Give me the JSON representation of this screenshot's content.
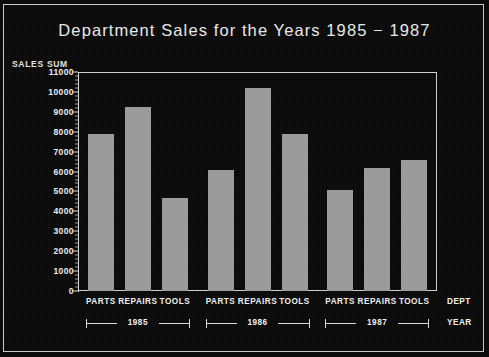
{
  "chart_data": {
    "type": "bar",
    "title": "Department Sales for the Years 1985 − 1987",
    "xlabel": "DEPT",
    "ylabel": "SALES SUM",
    "grid": false,
    "legend": "none",
    "ylim": [
      0,
      11000
    ],
    "ytick_step": 1000,
    "ytick_labels": [
      "11000",
      "10000",
      "9000",
      "8000",
      "7000",
      "6000",
      "5000",
      "4000",
      "3000",
      "2000",
      "1000",
      "0"
    ],
    "group_axis_label": "YEAR",
    "categories": [
      "PARTS",
      "REPAIRS",
      "TOOLS"
    ],
    "groups": [
      "1985",
      "1986",
      "1987"
    ],
    "bars": [
      {
        "group": "1985",
        "category": "PARTS",
        "value": 7900
      },
      {
        "group": "1985",
        "category": "REPAIRS",
        "value": 9250
      },
      {
        "group": "1985",
        "category": "TOOLS",
        "value": 4650
      },
      {
        "group": "1986",
        "category": "PARTS",
        "value": 6100
      },
      {
        "group": "1986",
        "category": "REPAIRS",
        "value": 10200
      },
      {
        "group": "1986",
        "category": "TOOLS",
        "value": 7900
      },
      {
        "group": "1987",
        "category": "PARTS",
        "value": 5050
      },
      {
        "group": "1987",
        "category": "REPAIRS",
        "value": 6200
      },
      {
        "group": "1987",
        "category": "TOOLS",
        "value": 6600
      }
    ],
    "colors": {
      "background": "#0b0b0b",
      "bar_fill": "#9b9b9b",
      "axis": "#d8d8d8",
      "text": "#ededed",
      "frame": "#c9c9c9"
    }
  }
}
